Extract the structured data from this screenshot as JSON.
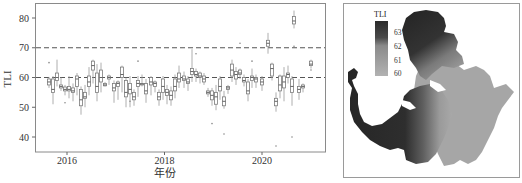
{
  "chart_data": [
    {
      "type": "boxplot",
      "title": "",
      "xlabel": "年份",
      "ylabel": "TLI",
      "ylim": [
        35,
        85
      ],
      "yticks": [
        40,
        50,
        60,
        70,
        80
      ],
      "xticks": [
        {
          "label": "2016",
          "year": 2016
        },
        {
          "label": "2018",
          "year": 2018
        },
        {
          "label": "2020",
          "year": 2020
        }
      ],
      "reference_lines": [
        {
          "y": 70,
          "style": "dashed"
        },
        {
          "y": 60,
          "style": "dashed"
        }
      ],
      "grid": false,
      "start_year_fraction": 2015.62,
      "month_step": 0.0833,
      "boxes": [
        {
          "q1": 57.5,
          "med": 58.5,
          "q3": 59.5,
          "lo": 56.5,
          "hi": 60.2,
          "out": [
            65
          ]
        },
        {
          "q1": 55.0,
          "med": 56.0,
          "q3": 59.5,
          "lo": 51.0,
          "hi": 60.5,
          "out": []
        },
        {
          "q1": 59.0,
          "med": 60.0,
          "q3": 61.5,
          "lo": 57.0,
          "hi": 66.0,
          "out": []
        },
        {
          "q1": 56.5,
          "med": 57.0,
          "q3": 57.5,
          "lo": 55.5,
          "hi": 60.0,
          "out": []
        },
        {
          "q1": 55.5,
          "med": 56.0,
          "q3": 56.8,
          "lo": 54.0,
          "hi": 57.5,
          "out": [
            51.5
          ]
        },
        {
          "q1": 55.5,
          "med": 56.0,
          "q3": 57.0,
          "lo": 53.0,
          "hi": 60.5,
          "out": []
        },
        {
          "q1": 55.0,
          "med": 55.5,
          "q3": 56.5,
          "lo": 52.0,
          "hi": 58.0,
          "out": []
        },
        {
          "q1": 57.0,
          "med": 59.5,
          "q3": 60.5,
          "lo": 54.0,
          "hi": 61.5,
          "out": []
        },
        {
          "q1": 50.5,
          "med": 52.5,
          "q3": 56.0,
          "lo": 47.5,
          "hi": 57.0,
          "out": []
        },
        {
          "q1": 53.0,
          "med": 53.5,
          "q3": 55.0,
          "lo": 50.0,
          "hi": 57.5,
          "out": []
        },
        {
          "q1": 57.0,
          "med": 58.5,
          "q3": 60.5,
          "lo": 54.0,
          "hi": 63.5,
          "out": []
        },
        {
          "q1": 62.5,
          "med": 64.0,
          "q3": 65.5,
          "lo": 58.0,
          "hi": 66.0,
          "out": []
        },
        {
          "q1": 55.0,
          "med": 57.0,
          "q3": 61.5,
          "lo": 52.0,
          "hi": 64.5,
          "out": []
        },
        {
          "q1": 58.5,
          "med": 60.0,
          "q3": 62.5,
          "lo": 55.0,
          "hi": 65.0,
          "out": []
        },
        {
          "q1": 57.2,
          "med": 57.5,
          "q3": 58.0,
          "lo": 57.0,
          "hi": 58.5,
          "out": []
        },
        {
          "q1": 59.5,
          "med": 60.0,
          "q3": 60.5,
          "lo": 57.5,
          "hi": 61.0,
          "out": []
        },
        {
          "q1": 55.5,
          "med": 56.5,
          "q3": 58.0,
          "lo": 51.5,
          "hi": 59.0,
          "out": []
        },
        {
          "q1": 57.0,
          "med": 58.0,
          "q3": 58.5,
          "lo": 52.5,
          "hi": 59.0,
          "out": []
        },
        {
          "q1": 60.0,
          "med": 61.0,
          "q3": 63.5,
          "lo": 55.0,
          "hi": 64.0,
          "out": []
        },
        {
          "q1": 53.5,
          "med": 55.0,
          "q3": 59.0,
          "lo": 50.0,
          "hi": 60.0,
          "out": []
        },
        {
          "q1": 54.5,
          "med": 56.0,
          "q3": 58.0,
          "lo": 50.0,
          "hi": 60.5,
          "out": [
            52.0
          ]
        },
        {
          "q1": 52.5,
          "med": 53.5,
          "q3": 55.0,
          "lo": 50.5,
          "hi": 56.0,
          "out": []
        },
        {
          "q1": 57.0,
          "med": 58.0,
          "q3": 59.0,
          "lo": 53.5,
          "hi": 60.5,
          "out": [
            65.5
          ]
        },
        {
          "q1": 57.5,
          "med": 57.8,
          "q3": 58.0,
          "lo": 57.0,
          "hi": 61.0,
          "out": []
        },
        {
          "q1": 54.5,
          "med": 55.5,
          "q3": 58.0,
          "lo": 51.5,
          "hi": 59.5,
          "out": []
        },
        {
          "q1": 57.5,
          "med": 58.5,
          "q3": 60.0,
          "lo": 54.0,
          "hi": 60.5,
          "out": []
        },
        {
          "q1": 57.0,
          "med": 58.0,
          "q3": 58.5,
          "lo": 55.0,
          "hi": 59.0,
          "out": []
        },
        {
          "q1": 52.5,
          "med": 53.5,
          "q3": 55.0,
          "lo": 50.5,
          "hi": 56.0,
          "out": []
        },
        {
          "q1": 55.0,
          "med": 57.0,
          "q3": 59.5,
          "lo": 52.5,
          "hi": 60.5,
          "out": []
        },
        {
          "q1": 54.0,
          "med": 55.0,
          "q3": 56.0,
          "lo": 51.0,
          "hi": 57.5,
          "out": []
        },
        {
          "q1": 52.5,
          "med": 54.0,
          "q3": 55.5,
          "lo": 50.5,
          "hi": 57.0,
          "out": []
        },
        {
          "q1": 55.5,
          "med": 57.0,
          "q3": 59.5,
          "lo": 53.0,
          "hi": 61.0,
          "out": []
        },
        {
          "q1": 58.5,
          "med": 59.5,
          "q3": 61.5,
          "lo": 56.5,
          "hi": 64.0,
          "out": []
        },
        {
          "q1": 59.0,
          "med": 59.5,
          "q3": 60.5,
          "lo": 56.5,
          "hi": 62.0,
          "out": []
        },
        {
          "q1": 58.0,
          "med": 58.5,
          "q3": 59.5,
          "lo": 55.5,
          "hi": 60.5,
          "out": []
        },
        {
          "q1": 61.0,
          "med": 62.0,
          "q3": 63.0,
          "lo": 58.5,
          "hi": 69.5,
          "out": []
        },
        {
          "q1": 60.5,
          "med": 61.0,
          "q3": 62.0,
          "lo": 58.5,
          "hi": 63.0,
          "out": [
            68.0
          ]
        },
        {
          "q1": 60.0,
          "med": 60.5,
          "q3": 61.5,
          "lo": 58.0,
          "hi": 62.0,
          "out": []
        },
        {
          "q1": 58.5,
          "med": 59.5,
          "q3": 60.5,
          "lo": 57.5,
          "hi": 61.5,
          "out": []
        },
        {
          "q1": 54.5,
          "med": 55.0,
          "q3": 55.5,
          "lo": 53.5,
          "hi": 56.5,
          "out": []
        },
        {
          "q1": 52.5,
          "med": 54.0,
          "q3": 55.5,
          "lo": 50.5,
          "hi": 56.5,
          "out": [
            44.5
          ]
        },
        {
          "q1": 51.0,
          "med": 53.5,
          "q3": 55.0,
          "lo": 49.0,
          "hi": 57.5,
          "out": []
        },
        {
          "q1": 55.5,
          "med": 57.0,
          "q3": 59.5,
          "lo": 52.5,
          "hi": 60.5,
          "out": []
        },
        {
          "q1": 50.5,
          "med": 52.0,
          "q3": 53.5,
          "lo": 49.5,
          "hi": 55.5,
          "out": [
            41.0
          ]
        },
        {
          "q1": 56.0,
          "med": 56.5,
          "q3": 57.0,
          "lo": 54.5,
          "hi": 57.5,
          "out": []
        },
        {
          "q1": 60.5,
          "med": 62.5,
          "q3": 64.5,
          "lo": 58.5,
          "hi": 66.0,
          "out": []
        },
        {
          "q1": 59.5,
          "med": 61.0,
          "q3": 62.0,
          "lo": 57.5,
          "hi": 63.5,
          "out": []
        },
        {
          "q1": 61.0,
          "med": 61.5,
          "q3": 62.5,
          "lo": 59.5,
          "hi": 63.0,
          "out": [
            71.5
          ]
        },
        {
          "q1": 58.5,
          "med": 59.0,
          "q3": 60.0,
          "lo": 57.0,
          "hi": 61.0,
          "out": []
        },
        {
          "q1": 54.5,
          "med": 55.5,
          "q3": 58.5,
          "lo": 52.0,
          "hi": 59.5,
          "out": []
        },
        {
          "q1": 59.0,
          "med": 60.0,
          "q3": 60.5,
          "lo": 56.5,
          "hi": 63.0,
          "out": [
            65.5
          ]
        },
        {
          "q1": 58.5,
          "med": 59.5,
          "q3": 60.0,
          "lo": 56.5,
          "hi": 61.0,
          "out": []
        },
        {
          "q1": 57.5,
          "med": 58.5,
          "q3": 59.5,
          "lo": 55.5,
          "hi": 60.5,
          "out": []
        },
        {
          "q1": 70.5,
          "med": 71.5,
          "q3": 72.5,
          "lo": 68.0,
          "hi": 75.0,
          "out": []
        },
        {
          "q1": 60.5,
          "med": 63.0,
          "q3": 64.5,
          "lo": 59.0,
          "hi": 65.0,
          "out": []
        },
        {
          "q1": 50.5,
          "med": 52.0,
          "q3": 53.0,
          "lo": 48.5,
          "hi": 55.0,
          "out": [
            37.0
          ]
        },
        {
          "q1": 55.5,
          "med": 57.5,
          "q3": 60.5,
          "lo": 53.0,
          "hi": 61.0,
          "out": []
        },
        {
          "q1": 56.5,
          "med": 58.5,
          "q3": 60.5,
          "lo": 52.0,
          "hi": 63.5,
          "out": []
        },
        {
          "q1": 60.0,
          "med": 61.0,
          "q3": 61.5,
          "lo": 58.0,
          "hi": 64.0,
          "out": []
        },
        {
          "q1": 55.0,
          "med": 57.0,
          "q3": 59.5,
          "lo": 50.5,
          "hi": 60.5,
          "out": [
            40.0
          ]
        },
        {
          "q1": 78.0,
          "med": 79.0,
          "q3": 80.5,
          "lo": 76.5,
          "hi": 82.5,
          "out": [
            70.5
          ]
        },
        {
          "q1": 55.0,
          "med": 56.0,
          "q3": 57.0,
          "lo": 52.5,
          "hi": 59.5,
          "out": []
        },
        {
          "q1": 56.5,
          "med": 57.0,
          "q3": 57.5,
          "lo": 55.0,
          "hi": 58.0,
          "out": []
        },
        {
          "q1": 64.0,
          "med": 64.5,
          "q3": 65.5,
          "lo": 63.0,
          "hi": 66.0,
          "out": [
            62.5
          ]
        }
      ],
      "box_x_px": [
        49,
        53,
        57,
        61,
        65,
        69,
        73,
        77,
        81,
        85,
        89,
        93,
        97,
        101,
        105,
        109,
        114,
        118,
        122,
        126,
        130,
        134,
        138,
        142,
        146,
        151,
        155,
        159,
        163,
        167,
        171,
        175,
        179,
        184,
        188,
        192,
        196,
        200,
        204,
        208,
        212,
        216,
        220,
        224,
        228,
        232,
        236,
        240,
        244,
        248,
        252,
        256,
        262,
        268,
        272,
        276,
        280,
        284,
        288,
        292,
        294,
        299,
        303,
        311
      ]
    },
    {
      "type": "heatmap",
      "title": "",
      "legend_title": "TLI",
      "colorbar_ticks": [
        63,
        62,
        61,
        60
      ],
      "colorbar_range": [
        59.6,
        63.6
      ],
      "colormap": [
        "#2b2b2b",
        "#5a5a5a",
        "#8a8a8a",
        "#a4a4a4",
        "#b4b4b4"
      ],
      "description": "Spatial distribution map of TLI: high values (~63) in the northern bay and western arm, lower values (~60-61) in the central and southeastern lake area"
    }
  ],
  "left_panel": {
    "ylabel": "TLI",
    "xlabel": "年份",
    "ytick_labels": [
      "80",
      "70",
      "60",
      "50",
      "40"
    ],
    "xtick_labels": [
      "2016",
      "2018",
      "2020"
    ]
  },
  "right_panel": {
    "legend_title": "TLI",
    "legend_labels": [
      "63",
      "62",
      "61",
      "60"
    ]
  }
}
